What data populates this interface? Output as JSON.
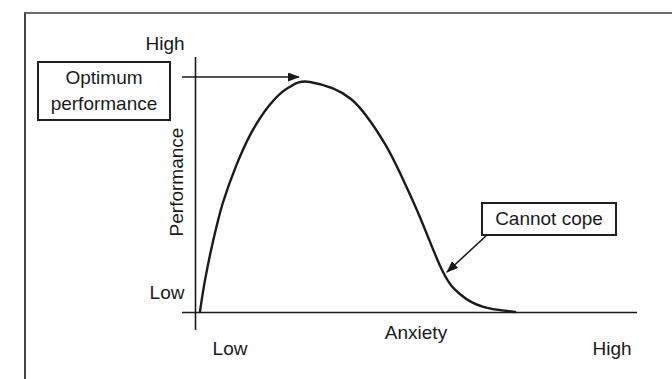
{
  "figure": {
    "kind": "performance-anxiety curve figure",
    "labels": {
      "y_axis_title": "Performance",
      "y_high": "High",
      "y_low": "Low",
      "x_axis_title": "Anxiety",
      "x_low": "Low",
      "x_high": "High",
      "optimum_callout": "Optimum performance",
      "cannot_cope_callout": "Cannot cope"
    },
    "colors": {
      "line": "#1a1a1a",
      "frame": "#555555",
      "box_border": "#1f1f1f",
      "background": "#ffffff"
    }
  },
  "chart_data": {
    "type": "line",
    "title": "",
    "xlabel": "Anxiety",
    "ylabel": "Performance",
    "x_axis_ticks": [
      "Low",
      "High"
    ],
    "y_axis_ticks": [
      "Low",
      "High"
    ],
    "axes_quantitative": false,
    "grid": false,
    "legend": false,
    "series": [
      {
        "name": "performance vs anxiety (inverted-U, right-skewed tail)",
        "points_normalized": [
          [
            0.011,
            0.0
          ],
          [
            0.023,
            0.143
          ],
          [
            0.041,
            0.309
          ],
          [
            0.063,
            0.474
          ],
          [
            0.093,
            0.635
          ],
          [
            0.127,
            0.778
          ],
          [
            0.167,
            0.896
          ],
          [
            0.21,
            0.974
          ],
          [
            0.26,
            1.0
          ],
          [
            0.353,
            0.926
          ],
          [
            0.43,
            0.73
          ],
          [
            0.498,
            0.461
          ],
          [
            0.561,
            0.174
          ],
          [
            0.602,
            0.074
          ],
          [
            0.652,
            0.022
          ],
          [
            0.724,
            0.0
          ]
        ]
      }
    ],
    "annotations": [
      {
        "text": "Optimum performance",
        "points_to": "peak of curve",
        "target_normalized": [
          0.26,
          1.0
        ]
      },
      {
        "text": "Cannot cope",
        "points_to": "steep descending tail of curve",
        "target_normalized": [
          0.56,
          0.17
        ]
      }
    ]
  }
}
